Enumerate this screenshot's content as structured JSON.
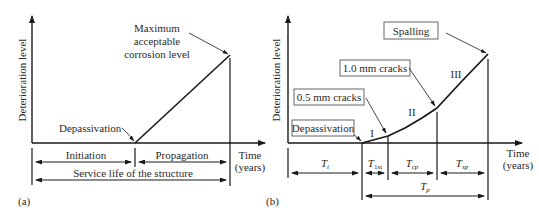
{
  "panel_a": {
    "tag": "(a)",
    "y_axis_label": "Deterioration level",
    "x_axis_label_line1": "Time",
    "x_axis_label_line2": "(years)",
    "annotation_max_line1": "Maximum",
    "annotation_max_line2": "acceptable",
    "annotation_max_line3": "corrosion level",
    "annotation_depassivation": "Depassivation",
    "phase_initiation": "Initiation",
    "phase_propagation": "Propagation",
    "service_life": "Service life of the structure"
  },
  "panel_b": {
    "tag": "(b)",
    "y_axis_label": "Deterioration level",
    "x_axis_label_line1": "Time",
    "x_axis_label_line2": "(years)",
    "box_spalling": "Spalling",
    "box_crack_1_0": "1.0 mm cracks",
    "box_crack_0_5": "0.5 mm cracks",
    "box_depassivation": "Depassivation",
    "stage_1": "I",
    "stage_2": "II",
    "stage_3": "III",
    "interval_ti": {
      "main": "T",
      "sub": "i"
    },
    "interval_t1st": {
      "main": "T",
      "sub": "1st"
    },
    "interval_tcp": {
      "main": "T",
      "sub": "cp"
    },
    "interval_tsp": {
      "main": "T",
      "sub": "sp"
    },
    "interval_tp": {
      "main": "T",
      "sub": "p"
    }
  },
  "colors": {
    "line": "#1a1a1a",
    "text": "#2a2a2a",
    "box_border": "#555555"
  }
}
